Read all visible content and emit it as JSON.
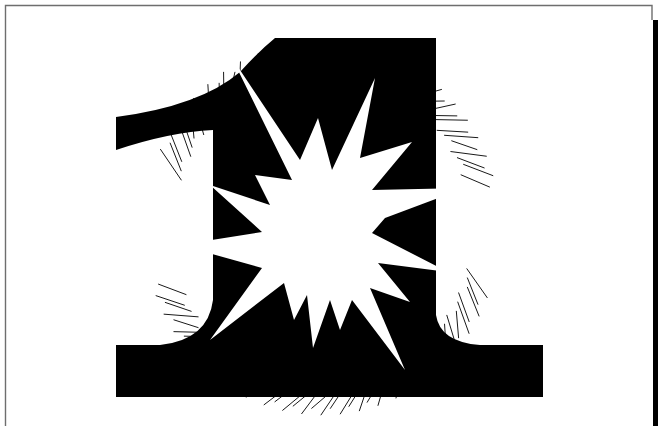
{
  "artwork": {
    "subject": "numeral-one-with-starburst",
    "colors": {
      "ink": "#000000",
      "paper": "#ffffff",
      "frame": "#6e6e6e"
    },
    "frame": {
      "left": 5,
      "top": 5,
      "right": 652,
      "bottom": 426,
      "side_bar": {
        "x": 653,
        "y": 20,
        "width": 5,
        "height": 406
      }
    },
    "numeral": {
      "label": "1",
      "stem": {
        "left": 213,
        "right": 436,
        "top": 38,
        "bottom": 345
      },
      "flag": {
        "tip_x": 116,
        "tip_top": 117,
        "tip_bottom": 150
      },
      "base": {
        "left": 116,
        "right": 543,
        "top": 345,
        "bottom": 397
      }
    },
    "starburst": {
      "center": [
        322,
        232
      ],
      "points": [
        [
          232,
          58
        ],
        [
          300,
          160
        ],
        [
          318,
          118
        ],
        [
          332,
          170
        ],
        [
          375,
          78
        ],
        [
          360,
          158
        ],
        [
          412,
          142
        ],
        [
          372,
          190
        ],
        [
          465,
          188
        ],
        [
          385,
          218
        ],
        [
          372,
          233
        ],
        [
          448,
          272
        ],
        [
          378,
          263
        ],
        [
          410,
          302
        ],
        [
          370,
          288
        ],
        [
          405,
          370
        ],
        [
          352,
          300
        ],
        [
          340,
          330
        ],
        [
          330,
          300
        ],
        [
          313,
          348
        ],
        [
          307,
          295
        ],
        [
          294,
          320
        ],
        [
          284,
          283
        ],
        [
          210,
          340
        ],
        [
          262,
          268
        ],
        [
          180,
          245
        ],
        [
          262,
          232
        ],
        [
          210,
          185
        ],
        [
          270,
          205
        ],
        [
          255,
          175
        ],
        [
          292,
          180
        ]
      ]
    },
    "hatching": {
      "left_arc": {
        "cx": 322,
        "cy": 228,
        "r_inner": 150,
        "r_outer": 178,
        "start_deg": 105,
        "end_deg": 245,
        "count": 46
      },
      "right_arc": {
        "cx": 322,
        "cy": 228,
        "r_inner": 148,
        "r_outer": 178,
        "start_deg": -72,
        "end_deg": 70,
        "count": 46
      }
    }
  }
}
